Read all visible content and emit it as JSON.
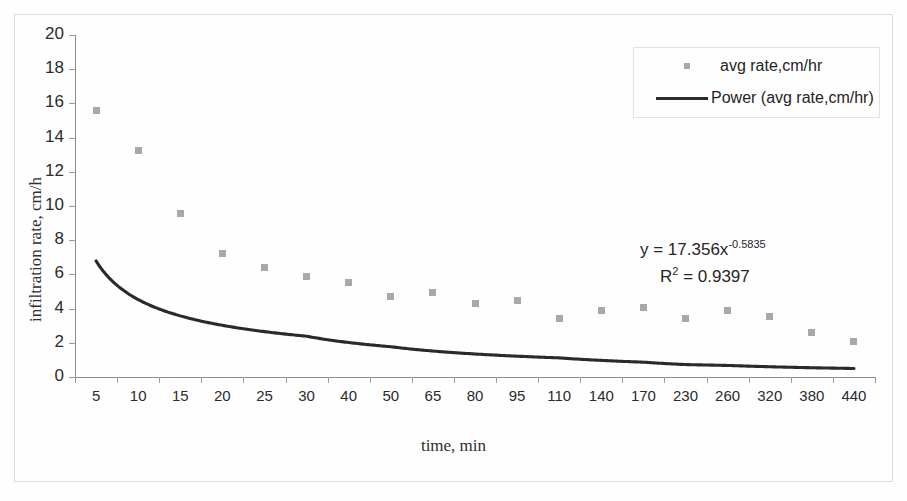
{
  "chart_data": {
    "type": "scatter",
    "title": "",
    "xlabel": "time, min",
    "ylabel": "infiltration rate, cm/h",
    "categories": [
      5,
      10,
      15,
      20,
      25,
      30,
      40,
      50,
      65,
      80,
      95,
      110,
      140,
      170,
      230,
      260,
      320,
      380,
      440
    ],
    "tick_labels": [
      "5",
      "10",
      "15",
      "20",
      "25",
      "30",
      "40",
      "50",
      "65",
      "80",
      "95",
      "110",
      "140",
      "170",
      "230",
      "260",
      "320",
      "380",
      "440"
    ],
    "ylim": [
      0,
      20
    ],
    "y_ticks": [
      "0",
      "2",
      "4",
      "6",
      "8",
      "10",
      "12",
      "14",
      "16",
      "18",
      "20"
    ],
    "grid": false,
    "legend_position": "top-right",
    "series": [
      {
        "name": "avg rate,cm/hr",
        "kind": "scatter",
        "marker": "square",
        "color": "#a8a8a8",
        "values": [
          15.6,
          13.25,
          9.55,
          7.2,
          6.4,
          5.85,
          5.55,
          4.7,
          4.95,
          4.3,
          4.45,
          3.4,
          3.9,
          4.05,
          3.45,
          3.9,
          3.55,
          2.6,
          2.1
        ]
      },
      {
        "name": "Power (avg rate,cm/hr)",
        "kind": "line-fit",
        "fit": "power",
        "color": "#2a2a2a",
        "coefficient": 17.356,
        "exponent": -0.5835,
        "values": [
          17.4,
          11.6,
          9.2,
          7.75,
          6.8,
          6.1,
          5.1,
          4.5,
          3.9,
          3.45,
          3.15,
          2.9,
          2.5,
          2.25,
          1.9,
          1.8,
          1.6,
          1.45,
          1.32
        ]
      }
    ],
    "annotations": {
      "equation_prefix": "y = 17.356x",
      "equation_exponent": "-0.5835",
      "r_squared_prefix": "R",
      "r_squared_sup": "2",
      "r_squared_value": " = 0.9397"
    }
  },
  "legend": {
    "items": [
      {
        "label": "avg rate,cm/hr",
        "swatch": "square-marker"
      },
      {
        "label": "Power (avg rate,cm/hr)",
        "swatch": "line-segment"
      }
    ]
  },
  "colors": {
    "marker": "#a8a8a8",
    "trendline": "#2a2a2a",
    "axis": "#8c8c8c",
    "frame": "#dcdcdc",
    "text": "#262626",
    "background": "#fefefe"
  }
}
